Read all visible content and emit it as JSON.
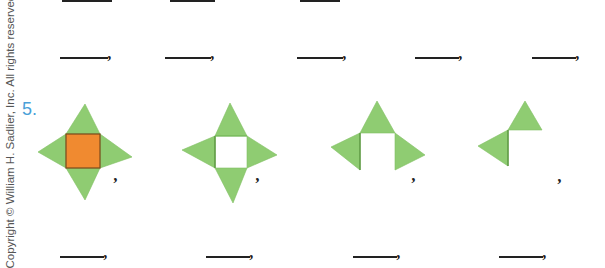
{
  "copyright": "Copyright © William H. Sadlier, Inc. All rights reserved.",
  "colors": {
    "label": "#4a9fd8",
    "green": "#8fcc72",
    "green_dark": "#6fb352",
    "orange": "#f08a30",
    "orange_border": "#7a4a1c",
    "ink": "#222222"
  },
  "row1_blanks": [
    {
      "comma": ","
    },
    {
      "comma": ","
    },
    {
      "comma": ","
    },
    {
      "comma": ","
    },
    {
      "comma": ","
    }
  ],
  "exercise": {
    "number": "5.",
    "figures": [
      {
        "description": "four green triangles around orange square",
        "comma": ","
      },
      {
        "description": "four green triangles around empty square",
        "comma": ","
      },
      {
        "description": "three green triangles",
        "comma": ","
      },
      {
        "description": "two green triangles",
        "comma": ","
      }
    ],
    "answer_blanks": [
      {
        "comma": ","
      },
      {
        "comma": ","
      },
      {
        "comma": ","
      },
      {
        "comma": ","
      }
    ]
  }
}
